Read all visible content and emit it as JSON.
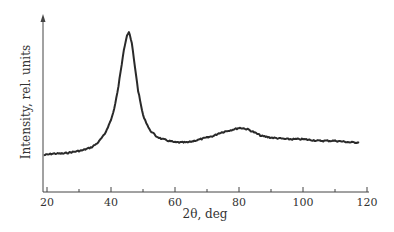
{
  "chart_data": {
    "type": "line",
    "title": "",
    "xlabel": "2θ, deg",
    "ylabel": "Intensity, rel. units",
    "xlim": [
      18,
      120
    ],
    "ylim": [
      0,
      105
    ],
    "grid": false,
    "legend": null,
    "x_ticks": [
      20,
      40,
      60,
      80,
      100,
      120
    ],
    "x_minor_ticks": [
      30,
      50,
      70,
      90,
      110
    ],
    "y_ticks": [],
    "series": [
      {
        "name": "XRD pattern",
        "color": "#2a2a2a",
        "x": [
          19,
          22,
          25,
          28,
          31,
          34,
          36,
          38,
          40,
          41,
          42,
          43,
          44,
          45,
          45.6,
          46.5,
          47.5,
          48.5,
          50,
          52,
          54,
          56,
          58,
          60,
          62,
          64,
          66,
          68,
          70,
          72,
          74,
          76,
          78,
          80,
          81,
          83,
          85,
          87,
          90,
          95,
          100,
          105,
          110,
          115,
          117.5
        ],
        "y": [
          23,
          24,
          24,
          25,
          26,
          28,
          31,
          36,
          45,
          52,
          62,
          75,
          89,
          98,
          100,
          93,
          78,
          63,
          48,
          39,
          35,
          33,
          32,
          31,
          31,
          31,
          32,
          33,
          34,
          35,
          37,
          38,
          39,
          40,
          40,
          39,
          37,
          35,
          34,
          33,
          33,
          32,
          32,
          31,
          31
        ]
      }
    ],
    "annotations": []
  },
  "labels": {
    "xlabel": "2θ, deg",
    "ylabel": "Intensity, rel. units",
    "ticks": [
      "20",
      "40",
      "60",
      "80",
      "100",
      "120"
    ]
  }
}
